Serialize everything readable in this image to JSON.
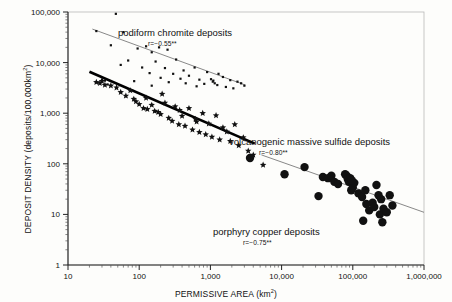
{
  "chart_data": {
    "type": "scatter",
    "title": "",
    "xlabel": "PERMISSIVE AREA (km²)",
    "ylabel": "DEPOSIT DENSITY (deposits/100,000km²)",
    "xscale": "log",
    "yscale": "log",
    "xlim": [
      10,
      1000000
    ],
    "ylim": [
      1,
      100000
    ],
    "grid": false,
    "legend_position": "inline-annotations",
    "xticks": [
      "10",
      "100",
      "1,000",
      "10,000",
      "100,000",
      "1,000,000"
    ],
    "xtick_values": [
      10,
      100,
      1000,
      10000,
      100000,
      1000000
    ],
    "yticks": [
      "1",
      "10",
      "100",
      "1,000",
      "10,000",
      "100,000"
    ],
    "ytick_values": [
      1,
      10,
      100,
      1000,
      10000,
      100000
    ],
    "series": [
      {
        "name": "podiform chromite deposits",
        "marker": "small-square-dot",
        "marker_size": 2.2,
        "color": "#111111",
        "correlation_label": "r=−0.55**",
        "correlation": -0.55,
        "fit_line": {
          "style": "thin-gray",
          "color": "#7a7a7a",
          "width": 0.9,
          "x_start": 22,
          "y_start": 46000,
          "x_end": 3100,
          "y_end": 3600
        },
        "points": [
          [
            60,
            160000
          ],
          [
            47,
            92000
          ],
          [
            25,
            42000
          ],
          [
            60,
            40000
          ],
          [
            40,
            22000
          ],
          [
            125,
            21000
          ],
          [
            190,
            20000
          ],
          [
            250,
            18000
          ],
          [
            95,
            19000
          ],
          [
            150,
            16000
          ],
          [
            70,
            11000
          ],
          [
            170,
            10500
          ],
          [
            330,
            11500
          ],
          [
            55,
            9000
          ],
          [
            110,
            8000
          ],
          [
            230,
            7800
          ],
          [
            420,
            7000
          ],
          [
            600,
            8000
          ],
          [
            140,
            6200
          ],
          [
            300,
            6000
          ],
          [
            500,
            5500
          ],
          [
            900,
            6500
          ],
          [
            1300,
            6000
          ],
          [
            200,
            5000
          ],
          [
            380,
            4800
          ],
          [
            700,
            4600
          ],
          [
            1100,
            4400
          ],
          [
            1500,
            5200
          ],
          [
            85,
            4300
          ],
          [
            260,
            4100
          ],
          [
            450,
            3900
          ],
          [
            820,
            3800
          ],
          [
            1250,
            3600
          ],
          [
            1900,
            4500
          ],
          [
            2400,
            4200
          ],
          [
            2700,
            3900
          ],
          [
            36,
            3700
          ],
          [
            150,
            3500
          ],
          [
            640,
            3400
          ],
          [
            1650,
            3300
          ],
          [
            2100,
            3100
          ],
          [
            3000,
            3500
          ],
          [
            30,
            4600
          ],
          [
            33,
            4400
          ],
          [
            1020,
            4700
          ],
          [
            1080,
            4200
          ],
          [
            1150,
            3900
          ]
        ]
      },
      {
        "name": "volcanogenic massive sulfide deposits",
        "marker": "star",
        "marker_size": 3.4,
        "color": "#111111",
        "correlation_label": "r=−0.80**",
        "correlation": -0.8,
        "fit_line": {
          "style": "thick-black",
          "color": "#000000",
          "width": 2.6,
          "x_start": 20,
          "y_start": 6600,
          "x_end": 4200,
          "y_end": 250
        },
        "points": [
          [
            25,
            4100
          ],
          [
            28,
            3900
          ],
          [
            30,
            4300
          ],
          [
            33,
            3600
          ],
          [
            40,
            3500
          ],
          [
            55,
            2600
          ],
          [
            65,
            2200
          ],
          [
            75,
            2800
          ],
          [
            90,
            1700
          ],
          [
            100,
            1500
          ],
          [
            115,
            1250
          ],
          [
            130,
            1200
          ],
          [
            150,
            1450
          ],
          [
            165,
            1100
          ],
          [
            185,
            1050
          ],
          [
            200,
            950
          ],
          [
            230,
            1600
          ],
          [
            260,
            800
          ],
          [
            290,
            700
          ],
          [
            320,
            1350
          ],
          [
            360,
            600
          ],
          [
            400,
            880
          ],
          [
            440,
            560
          ],
          [
            500,
            1250
          ],
          [
            560,
            470
          ],
          [
            620,
            760
          ],
          [
            700,
            420
          ],
          [
            780,
            1000
          ],
          [
            860,
            380
          ],
          [
            950,
            620
          ],
          [
            1050,
            340
          ],
          [
            1200,
            900
          ],
          [
            1350,
            300
          ],
          [
            1500,
            520
          ],
          [
            1700,
            430
          ],
          [
            1900,
            280
          ],
          [
            2200,
            600
          ],
          [
            2500,
            230
          ],
          [
            2900,
            330
          ],
          [
            3400,
            180
          ],
          [
            4000,
            150
          ],
          [
            5500,
            95
          ],
          [
            210,
            2400
          ],
          [
            125,
            2000
          ],
          [
            370,
            1150
          ],
          [
            48,
            3200
          ],
          [
            84,
            1900
          ],
          [
            640,
            680
          ]
        ]
      },
      {
        "name": "porphyry copper deposits",
        "marker": "large-circle",
        "marker_size": 4.2,
        "color": "#111111",
        "correlation_label": "r=−0.75**",
        "correlation": -0.75,
        "fit_line": {
          "style": "thin-gray",
          "color": "#7a7a7a",
          "width": 0.9,
          "x_start": 5200,
          "y_start": 150,
          "x_end": 1000000,
          "y_end": 11
        },
        "points": [
          [
            3600,
            130
          ],
          [
            11000,
            62
          ],
          [
            21000,
            86
          ],
          [
            38000,
            55
          ],
          [
            45000,
            52
          ],
          [
            50000,
            58
          ],
          [
            55000,
            44
          ],
          [
            62000,
            40
          ],
          [
            78000,
            62
          ],
          [
            82000,
            58
          ],
          [
            85000,
            50
          ],
          [
            88000,
            44
          ],
          [
            92000,
            52
          ],
          [
            95000,
            30
          ],
          [
            100000,
            34
          ],
          [
            105000,
            42
          ],
          [
            120000,
            26
          ],
          [
            135000,
            22
          ],
          [
            140000,
            7.5
          ],
          [
            150000,
            30
          ],
          [
            170000,
            12
          ],
          [
            190000,
            17
          ],
          [
            200000,
            14
          ],
          [
            215000,
            38
          ],
          [
            230000,
            24
          ],
          [
            240000,
            10
          ],
          [
            250000,
            20
          ],
          [
            270000,
            13
          ],
          [
            300000,
            11
          ],
          [
            330000,
            24
          ],
          [
            360000,
            15
          ],
          [
            33000,
            23
          ],
          [
            155000,
            16
          ],
          [
            260000,
            7
          ],
          [
            97000,
            47
          ]
        ]
      }
    ],
    "annotations": [
      {
        "text": "podiform chromite deposits",
        "sub_text": "r=−0.55**",
        "x_px": 118,
        "y_px": 27
      },
      {
        "text": "volcanogenic massive sulfide deposits",
        "sub_text": "r=−0.80**",
        "x_px": 229,
        "y_px": 136
      },
      {
        "text": "porphyry copper deposits",
        "sub_text": "r=−0.75**",
        "x_px": 213,
        "y_px": 226
      }
    ]
  },
  "axes": {
    "x_title": "PERMISSIVE AREA (km",
    "x_title_sup": "2",
    "x_title_end": ")",
    "y_title": "DEPOSIT DENSITY (deposits/100,000km",
    "y_title_sup": "2",
    "y_title_end": ")"
  }
}
